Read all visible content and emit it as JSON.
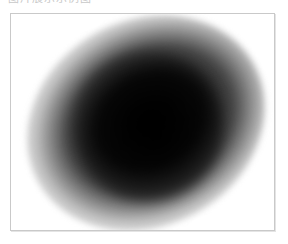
{
  "caption": {
    "text": "图片展示示例图"
  },
  "image": {
    "description": "blurred dark elliptical blob on white background",
    "border_color": "#c9c9c9",
    "blob_color": "#000000",
    "background_color": "#ffffff"
  }
}
